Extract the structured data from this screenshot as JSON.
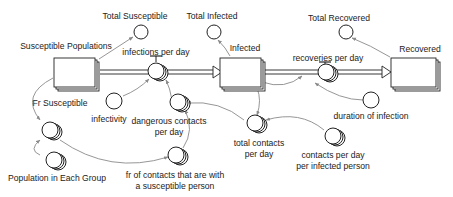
{
  "diagram": {
    "type": "stock-and-flow",
    "stocks": [
      {
        "id": "susceptible",
        "label": "Susceptible Populations",
        "stacked": true
      },
      {
        "id": "infected",
        "label": "Infected",
        "stacked": true
      },
      {
        "id": "recovered",
        "label": "Recovered",
        "stacked": true
      }
    ],
    "flows": [
      {
        "id": "infections",
        "label": "infections per day",
        "from": "susceptible",
        "to": "infected"
      },
      {
        "id": "recoveries",
        "label": "recoveries per day",
        "from": "infected",
        "to": "recovered"
      }
    ],
    "auxiliaries": [
      {
        "id": "total_susceptible",
        "label": "Total Susceptible",
        "stacked": false
      },
      {
        "id": "total_infected",
        "label": "Total Infected",
        "stacked": false
      },
      {
        "id": "total_recovered",
        "label": "Total Recovered",
        "stacked": false
      },
      {
        "id": "infectivity",
        "label": "infectivity",
        "stacked": false
      },
      {
        "id": "dangerous_contacts",
        "label_lines": [
          "dangerous contacts",
          "per day"
        ],
        "stacked": true
      },
      {
        "id": "fr_susceptible",
        "label": "Fr Susceptible",
        "stacked": true
      },
      {
        "id": "population_each_group",
        "label": "Population in Each Group",
        "stacked": true
      },
      {
        "id": "fr_contacts",
        "label_lines": [
          "fr of contacts that are with",
          "a susceptible person"
        ],
        "stacked": true
      },
      {
        "id": "total_contacts",
        "label_lines": [
          "total contacts",
          "per day"
        ],
        "stacked": true
      },
      {
        "id": "contacts_per_infected",
        "label_lines": [
          "contacts per day",
          "per infected person"
        ],
        "stacked": true
      },
      {
        "id": "duration_infection",
        "label": "duration of infection",
        "stacked": false
      }
    ],
    "links": [
      {
        "from": "susceptible",
        "to": "total_susceptible"
      },
      {
        "from": "infected",
        "to": "total_infected"
      },
      {
        "from": "recovered",
        "to": "total_recovered"
      },
      {
        "from": "infectivity",
        "to": "infections"
      },
      {
        "from": "dangerous_contacts",
        "to": "infections"
      },
      {
        "from": "susceptible",
        "to": "fr_susceptible"
      },
      {
        "from": "population_each_group",
        "to": "fr_susceptible"
      },
      {
        "from": "fr_susceptible",
        "to": "fr_contacts"
      },
      {
        "from": "fr_contacts",
        "to": "dangerous_contacts"
      },
      {
        "from": "total_contacts",
        "to": "dangerous_contacts"
      },
      {
        "from": "infected",
        "to": "total_contacts"
      },
      {
        "from": "contacts_per_infected",
        "to": "total_contacts"
      },
      {
        "from": "infected",
        "to": "recoveries"
      },
      {
        "from": "duration_infection",
        "to": "recoveries"
      }
    ],
    "colors": {
      "line": "#222222",
      "link": "#8a8a8a",
      "background": "#ffffff"
    }
  }
}
